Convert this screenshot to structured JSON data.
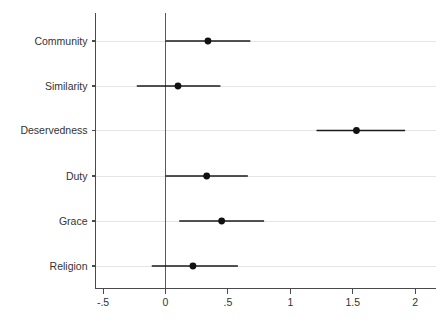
{
  "chart_data": {
    "type": "scatter",
    "subtype": "coefficient-plot",
    "title": "",
    "subtitle": "",
    "xlabel": "",
    "ylabel": "",
    "xlim": [
      -0.62,
      2.22
    ],
    "ylim": [
      0,
      7
    ],
    "grid": "horizontal",
    "legend": "none",
    "reference_line": 0,
    "x_ticks": [
      -0.5,
      0,
      0.5,
      1,
      1.5,
      2
    ],
    "x_tick_labels": [
      "-.5",
      "0",
      ".5",
      "1",
      "1.5",
      "2"
    ],
    "categories": [
      "Community",
      "Similarity",
      "Deservedness",
      "Duty",
      "Grace",
      "Religion"
    ],
    "series": [
      {
        "name": "coefficient",
        "values": [
          0.34,
          0.1,
          1.53,
          0.33,
          0.45,
          0.22
        ],
        "ci_low": [
          0.0,
          -0.23,
          1.21,
          0.0,
          0.11,
          -0.11
        ],
        "ci_high": [
          0.68,
          0.44,
          1.92,
          0.66,
          0.79,
          0.58
        ]
      }
    ],
    "points": [
      {
        "label": "Community",
        "estimate": 0.34,
        "ci_low": 0.0,
        "ci_high": 0.68
      },
      {
        "label": "Similarity",
        "estimate": 0.1,
        "ci_low": -0.23,
        "ci_high": 0.44
      },
      {
        "label": "Deservedness",
        "estimate": 1.53,
        "ci_low": 1.21,
        "ci_high": 1.92
      },
      {
        "label": "Duty",
        "estimate": 0.33,
        "ci_low": 0.0,
        "ci_high": 0.66
      },
      {
        "label": "Grace",
        "estimate": 0.45,
        "ci_low": 0.11,
        "ci_high": 0.79
      },
      {
        "label": "Religion",
        "estimate": 0.22,
        "ci_low": -0.11,
        "ci_high": 0.58
      }
    ],
    "colors": {
      "marker": "#111111",
      "ci": "#1a1a1a",
      "axis": "#4a4a4a",
      "grid": "#e2e2e2",
      "background": "#ffffff"
    }
  }
}
